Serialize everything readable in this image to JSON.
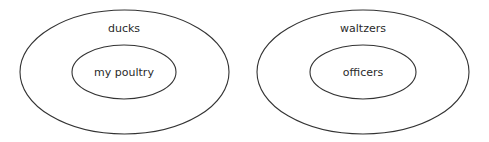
{
  "diagram": {
    "type": "nested-sets (Euler diagram)",
    "stroke_color": "#333333",
    "background": "#ffffff",
    "diagrams": [
      {
        "outer_label": "ducks",
        "inner_label": "my poultry",
        "relation": "my poultry ⊂ ducks"
      },
      {
        "outer_label": "waltzers",
        "inner_label": "officers",
        "relation": "officers ⊂ waltzers"
      }
    ]
  }
}
